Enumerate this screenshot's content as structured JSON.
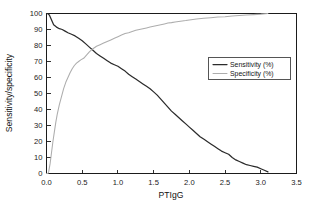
{
  "chart_data": {
    "type": "line",
    "title": "",
    "subtitle": "",
    "xlabel": "PTIgG",
    "ylabel": "Sensitivity/specificity",
    "xlim": [
      0.0,
      3.5
    ],
    "ylim": [
      0,
      100
    ],
    "xticks": [
      "0.0",
      "0.5",
      "1.0",
      "1.5",
      "2.0",
      "2.5",
      "3.0",
      "3.5"
    ],
    "xtick_values": [
      0.0,
      0.5,
      1.0,
      1.5,
      2.0,
      2.5,
      3.0,
      3.5
    ],
    "yticks": [
      "0",
      "10",
      "20",
      "30",
      "40",
      "50",
      "60",
      "70",
      "80",
      "90",
      "100"
    ],
    "ytick_values": [
      0,
      10,
      20,
      30,
      40,
      50,
      60,
      70,
      80,
      90,
      100
    ],
    "grid": false,
    "legend_position": "upper-right",
    "frame": "box",
    "series": [
      {
        "name": "Sensitivity (%)",
        "color": "#2b2b2b",
        "width": 1.25,
        "x": [
          0.0,
          0.02,
          0.04,
          0.06,
          0.08,
          0.1,
          0.14,
          0.18,
          0.22,
          0.26,
          0.3,
          0.35,
          0.4,
          0.45,
          0.5,
          0.55,
          0.6,
          0.65,
          0.7,
          0.75,
          0.8,
          0.85,
          0.9,
          0.95,
          1.0,
          1.05,
          1.1,
          1.15,
          1.2,
          1.25,
          1.3,
          1.35,
          1.4,
          1.45,
          1.5,
          1.55,
          1.6,
          1.65,
          1.7,
          1.75,
          1.8,
          1.85,
          1.9,
          1.95,
          2.0,
          2.05,
          2.1,
          2.15,
          2.2,
          2.25,
          2.3,
          2.35,
          2.4,
          2.45,
          2.5,
          2.55,
          2.6,
          2.65,
          2.7,
          2.75,
          2.8,
          2.85,
          2.9,
          2.95,
          3.0,
          3.05,
          3.1
        ],
        "y": [
          100,
          100,
          99,
          97,
          95,
          93,
          91.5,
          90.5,
          90,
          89,
          88,
          87,
          86,
          84.5,
          83,
          81,
          79,
          77,
          75,
          73.5,
          72,
          70.5,
          69,
          68,
          67,
          65.5,
          64,
          62,
          60.5,
          59,
          57.5,
          56,
          54.5,
          53,
          51,
          49,
          46.5,
          44,
          41.5,
          39,
          37,
          35,
          33,
          31,
          29,
          27,
          25,
          23,
          21.5,
          20,
          18.5,
          17,
          15.5,
          14,
          13,
          12,
          10,
          8.5,
          7.5,
          6.5,
          5.5,
          5,
          4.5,
          4,
          3,
          2,
          1
        ]
      },
      {
        "name": "Specificity (%)",
        "color": "#adadad",
        "width": 1.05,
        "x": [
          0.0,
          0.01,
          0.02,
          0.03,
          0.05,
          0.07,
          0.09,
          0.11,
          0.13,
          0.15,
          0.18,
          0.21,
          0.24,
          0.27,
          0.3,
          0.33,
          0.36,
          0.39,
          0.42,
          0.45,
          0.48,
          0.52,
          0.56,
          0.6,
          0.65,
          0.7,
          0.75,
          0.8,
          0.85,
          0.9,
          0.95,
          1.0,
          1.05,
          1.1,
          1.15,
          1.2,
          1.25,
          1.3,
          1.35,
          1.4,
          1.45,
          1.5,
          1.55,
          1.6,
          1.65,
          1.7,
          1.75,
          1.8,
          1.85,
          1.9,
          1.95,
          2.0,
          2.1,
          2.2,
          2.3,
          2.4,
          2.5,
          2.6,
          2.7,
          2.8,
          2.9,
          3.0,
          3.1
        ],
        "y": [
          0,
          0,
          0,
          1,
          6,
          13,
          20,
          26,
          32,
          37,
          43,
          48,
          53,
          57,
          60,
          63,
          65.5,
          67.5,
          69,
          70,
          71,
          72,
          74,
          76,
          78,
          79.5,
          80.5,
          81.5,
          82.5,
          83.5,
          84.5,
          85.5,
          86.5,
          87.5,
          88,
          88.8,
          89.5,
          90,
          90.5,
          91,
          91.5,
          92,
          92.5,
          93,
          93.5,
          94,
          94.3,
          94.7,
          95,
          95.3,
          95.6,
          96,
          96.5,
          97,
          97.4,
          97.8,
          98,
          98.4,
          98.7,
          99,
          99.3,
          99.6,
          100
        ]
      }
    ]
  },
  "legend": {
    "entries": [
      {
        "label": "Sensitivity (%)"
      },
      {
        "label": "Specificity (%)"
      }
    ]
  }
}
